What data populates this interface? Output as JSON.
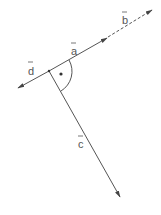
{
  "diagram": {
    "colors": {
      "line": "#555555",
      "background": "#ffffff"
    },
    "vectors": [
      {
        "name": "a",
        "label": "a",
        "style": "solid"
      },
      {
        "name": "b",
        "label": "b",
        "style": "dashed"
      },
      {
        "name": "c",
        "label": "c",
        "style": "solid"
      },
      {
        "name": "d",
        "label": "d",
        "style": "solid"
      }
    ],
    "right_angle_marker": {
      "symbol": "arc-with-dot",
      "between": [
        "a",
        "c"
      ]
    }
  }
}
